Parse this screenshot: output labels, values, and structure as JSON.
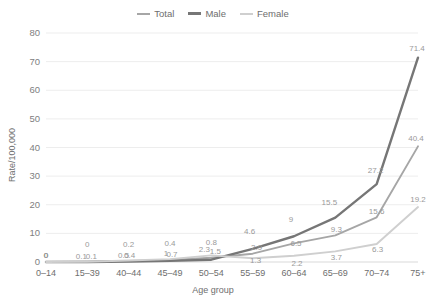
{
  "chart_data": {
    "type": "line",
    "title": "",
    "xlabel": "Age group",
    "ylabel": "Rate/100,000",
    "categories": [
      "0–14",
      "15–39",
      "40–44",
      "45–49",
      "50–54",
      "55–59",
      "60–64",
      "65–69",
      "70–74",
      "75+"
    ],
    "ylim": [
      0,
      80
    ],
    "yticks": [
      0,
      10,
      20,
      30,
      40,
      50,
      60,
      70,
      80
    ],
    "ytick_labels": [
      "0",
      "10",
      "20",
      "30",
      "40",
      "50",
      "60",
      "70",
      "80"
    ],
    "grid": "horizontal",
    "legend_position": "top-center",
    "series": [
      {
        "name": "Total",
        "color": "#a6a6a6",
        "values": [
          0,
          0.1,
          0.4,
          0.7,
          1.5,
          2.9,
          6.5,
          9.3,
          15.6,
          40.4
        ],
        "labels": [
          "0",
          "0.1",
          "0.4",
          "0.7",
          "1.5",
          "2.9",
          "6.5",
          "9.3",
          "15.6",
          "40.4"
        ]
      },
      {
        "name": "Male",
        "color": "#767676",
        "values": [
          0,
          0,
          0.2,
          0.4,
          0.8,
          4.6,
          9,
          15.5,
          27.2,
          71.4
        ],
        "labels": [
          "0",
          "0",
          "0.2",
          "0.4",
          "0.8",
          "4.6",
          "9",
          "15.5",
          "27.2",
          "71.4"
        ]
      },
      {
        "name": "Female",
        "color": "#cfcfcf",
        "values": [
          0,
          0.1,
          0.5,
          1,
          2.3,
          1.3,
          2.2,
          3.7,
          6.3,
          19.2
        ],
        "labels": [
          "0",
          "0.1",
          "0.5",
          "1",
          "2.3",
          "1.3",
          "2.2",
          "3.7",
          "6.3",
          "19.2"
        ]
      }
    ]
  },
  "legend": {
    "items": [
      {
        "label": "Total",
        "color": "#a6a6a6",
        "width": 2
      },
      {
        "label": "Male",
        "color": "#767676",
        "width": 3
      },
      {
        "label": "Female",
        "color": "#cfcfcf",
        "width": 2
      }
    ]
  },
  "axes": {
    "y_title": "Rate/100,000",
    "x_title": "Age group"
  }
}
